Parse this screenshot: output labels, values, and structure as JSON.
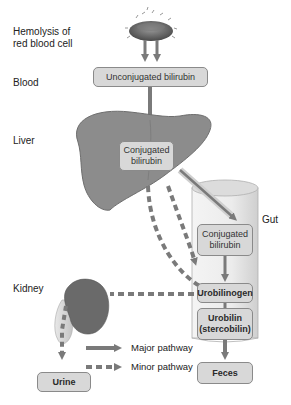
{
  "diagram": {
    "stage_labels": {
      "hemolysis": "Hemolysis of red blood cell",
      "blood": "Blood",
      "liver": "Liver",
      "gut": "Gut",
      "kidney": "Kidney"
    },
    "nodes": {
      "unconjugated": "Unconjugated bilirubin",
      "liver_conjugated": "Conjugated bilirubin",
      "gut_conjugated": "Conjugated bilirubin",
      "urobilinogen": "Urobilinogen",
      "urobilin": "Urobilin (stercobilin)",
      "feces": "Feces",
      "urine": "Urine"
    },
    "legend": {
      "major": "Major pathway",
      "minor": "Minor pathway"
    },
    "edges": [
      {
        "from": "red blood cell",
        "to": "unconjugated",
        "type": "major"
      },
      {
        "from": "unconjugated",
        "to": "liver_conjugated",
        "type": "major"
      },
      {
        "from": "liver_conjugated",
        "to": "gut_conjugated",
        "type": "major"
      },
      {
        "from": "gut_conjugated",
        "to": "urobilinogen",
        "type": "major"
      },
      {
        "from": "urobilinogen",
        "to": "urobilin",
        "type": "major"
      },
      {
        "from": "urobilin",
        "to": "feces",
        "type": "major"
      },
      {
        "from": "liver_conjugated",
        "to": "urobilinogen",
        "type": "minor"
      },
      {
        "from": "urobilinogen",
        "to": "liver_conjugated",
        "type": "minor"
      },
      {
        "from": "urobilinogen",
        "to": "kidney",
        "type": "minor"
      },
      {
        "from": "kidney",
        "to": "urine",
        "type": "minor"
      }
    ],
    "colors": {
      "arrow": "#7a7a7a",
      "box_fill": "#d8d8d8",
      "box_border": "#8a8a8a",
      "liver": "#8c8c8c",
      "kidney": "#6a6a6a",
      "gut": "#e6e6e6"
    }
  }
}
